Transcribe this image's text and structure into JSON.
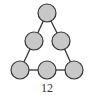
{
  "diagram": {
    "caption": "12",
    "node_fill": "#c8c8c8",
    "node_stroke": "#333333",
    "edge_color": "#333333",
    "nodes": [
      {
        "id": "n1",
        "x": 47,
        "y": 13
      },
      {
        "id": "n2",
        "x": 34,
        "y": 41
      },
      {
        "id": "n3",
        "x": 61,
        "y": 41
      },
      {
        "id": "n4",
        "x": 20,
        "y": 70
      },
      {
        "id": "n5",
        "x": 47,
        "y": 70
      },
      {
        "id": "n6",
        "x": 74,
        "y": 70
      }
    ],
    "edges": [
      [
        "n1",
        "n2"
      ],
      [
        "n1",
        "n3"
      ],
      [
        "n2",
        "n4"
      ],
      [
        "n3",
        "n6"
      ],
      [
        "n4",
        "n5"
      ],
      [
        "n5",
        "n6"
      ]
    ]
  }
}
